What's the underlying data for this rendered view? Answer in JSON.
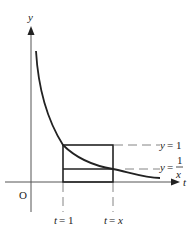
{
  "diagram": {
    "axes": {
      "x_label": "t",
      "y_label": "y",
      "origin_label": "O"
    },
    "curve": {
      "name": "y = 1/t",
      "equation": "y = 1/t"
    },
    "horizontal_lines": [
      {
        "label_lhs": "y",
        "label_eq": "=",
        "label_rhs": "1",
        "value": "1"
      },
      {
        "label_lhs": "y",
        "label_eq": "=",
        "label_num": "1",
        "label_den": "x",
        "value": "1/x"
      }
    ],
    "vertical_lines": [
      {
        "label": "t = 1",
        "lhs": "t",
        "eq": "=",
        "rhs": "1"
      },
      {
        "label": "t = x",
        "lhs": "t",
        "eq": "=",
        "rhs": "x"
      }
    ],
    "rectangles": [
      {
        "name": "outer-rectangle",
        "from_t": "1",
        "to_t": "x",
        "height": "1"
      },
      {
        "name": "inner-rectangle",
        "from_t": "1",
        "to_t": "x",
        "height": "1/x"
      }
    ],
    "colors": {
      "ink": "#222222",
      "axis": "#555555",
      "dash": "#777777",
      "background": "#ffffff"
    }
  }
}
